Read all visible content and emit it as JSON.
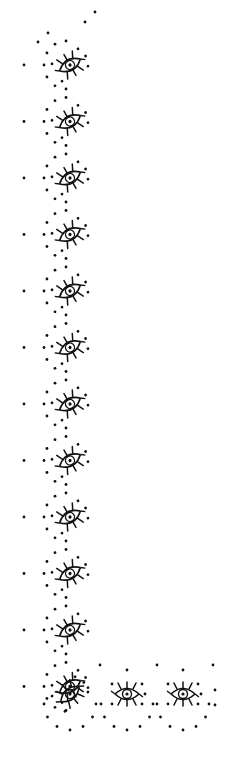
{
  "artwork": {
    "type": "decorative-border",
    "description": "L-shaped border of eye motifs surrounded by dotted scallops",
    "ink_color": "#111111",
    "background_color": "#ffffff",
    "vertical_column": {
      "motif_count": 12,
      "center_x": 70,
      "first_center_y": 65,
      "spacing": 56.5
    },
    "bottom_row": {
      "motif_count": 3,
      "center_y": 694,
      "centers_x": [
        70,
        127,
        183
      ]
    }
  }
}
